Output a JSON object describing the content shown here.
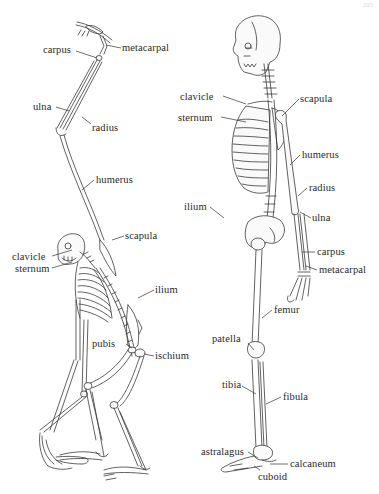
{
  "page_number": "205",
  "diagram": {
    "left_skeleton": {
      "name": "ape-skeleton",
      "labels": [
        {
          "id": "carpus",
          "text": "carpus"
        },
        {
          "id": "metacarpal",
          "text": "metacarpal"
        },
        {
          "id": "ulna",
          "text": "ulna"
        },
        {
          "id": "radius",
          "text": "radius"
        },
        {
          "id": "humerus",
          "text": "humerus"
        },
        {
          "id": "scapula",
          "text": "scapula"
        },
        {
          "id": "clavicle",
          "text": "clavicle"
        },
        {
          "id": "sternum",
          "text": "sternum"
        },
        {
          "id": "ilium",
          "text": "ilium"
        },
        {
          "id": "pubis",
          "text": "pubis"
        },
        {
          "id": "ischium",
          "text": "ischium"
        }
      ]
    },
    "right_skeleton": {
      "name": "human-skeleton",
      "labels": [
        {
          "id": "clavicle",
          "text": "clavicle"
        },
        {
          "id": "scapula",
          "text": "scapula"
        },
        {
          "id": "sternum",
          "text": "sternum"
        },
        {
          "id": "humerus",
          "text": "humerus"
        },
        {
          "id": "radius",
          "text": "radius"
        },
        {
          "id": "ilium",
          "text": "ilium"
        },
        {
          "id": "ulna",
          "text": "ulna"
        },
        {
          "id": "carpus",
          "text": "carpus"
        },
        {
          "id": "metacarpal",
          "text": "metacarpal"
        },
        {
          "id": "femur",
          "text": "femur"
        },
        {
          "id": "patella",
          "text": "patella"
        },
        {
          "id": "tibia",
          "text": "tibia"
        },
        {
          "id": "fibula",
          "text": "fibula"
        },
        {
          "id": "astralagus",
          "text": "astralagus"
        },
        {
          "id": "calcaneum",
          "text": "calcaneum"
        },
        {
          "id": "cuboid",
          "text": "cuboid"
        }
      ]
    }
  },
  "colors": {
    "background": "#ffffff",
    "ink": "#2a2a2a"
  }
}
